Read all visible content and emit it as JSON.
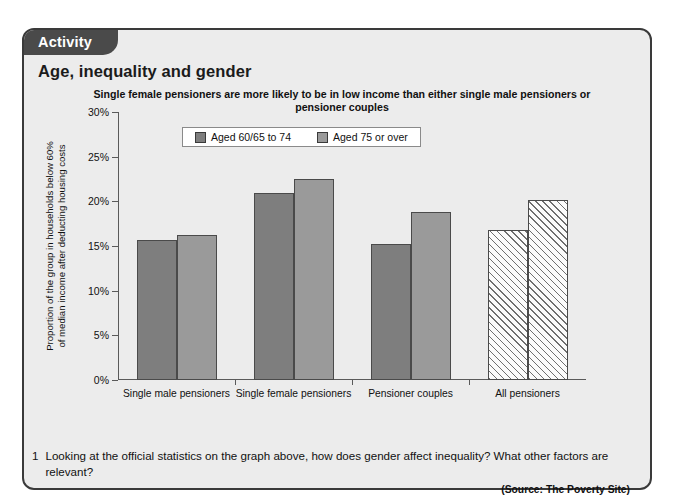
{
  "panel": {
    "tab_label": "Activity",
    "heading": "Age, inequality and gender"
  },
  "chart": {
    "source_note": "(Source: The Poverty Site)"
  },
  "question": {
    "number": "1",
    "text": "Looking at the official statistics on the graph above, how does gender affect inequality? What other factors are relevant?"
  },
  "chart_data": {
    "type": "bar",
    "title": "Single female pensioners are more likely to be in low income than either single male pensioners or pensioner couples",
    "xlabel": "",
    "ylabel": "Proportion of the group in households below 60% of median income after deducting housing costs",
    "ylabel_lines": [
      "Proportion of the group in households below 60%",
      "of median income after deducting housing costs"
    ],
    "categories": [
      "Single male pensioners",
      "Single female pensioners",
      "Pensioner couples",
      "All pensioners"
    ],
    "series": [
      {
        "name": "Aged 60/65 to 74",
        "color": "#7e7e7e",
        "values": [
          15.7,
          20.9,
          15.2,
          16.8
        ]
      },
      {
        "name": "Aged 75 or over",
        "color": "#9a9a9a",
        "values": [
          16.2,
          22.5,
          18.8,
          20.2
        ]
      }
    ],
    "hatched_category": "All pensioners",
    "ylim": [
      0,
      30
    ],
    "ytick_values": [
      0,
      5,
      10,
      15,
      20,
      25,
      30
    ],
    "ytick_labels": [
      "0%",
      "5%",
      "10%",
      "15%",
      "20%",
      "25%",
      "30%"
    ],
    "grid": false,
    "legend_position": "top-center",
    "value_suffix": "%"
  }
}
